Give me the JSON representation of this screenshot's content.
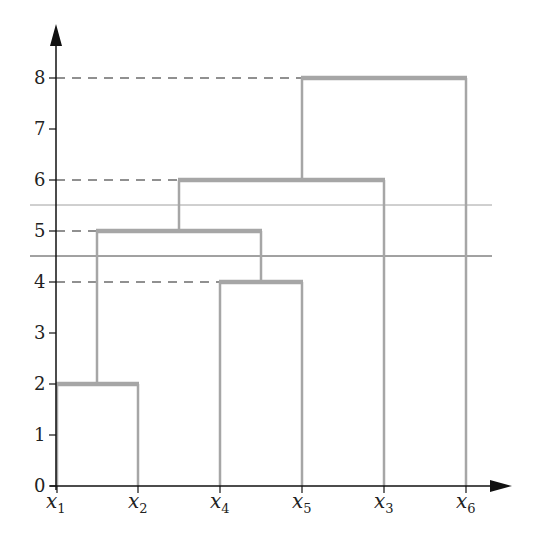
{
  "diagram": {
    "type": "dendrogram",
    "y_axis": {
      "ticks": [
        "0",
        "1",
        "2",
        "3",
        "4",
        "5",
        "6",
        "7",
        "8"
      ],
      "range": [
        0,
        8
      ]
    },
    "leaves": [
      {
        "base": "x",
        "sub": "1"
      },
      {
        "base": "x",
        "sub": "2"
      },
      {
        "base": "x",
        "sub": "4"
      },
      {
        "base": "x",
        "sub": "5"
      },
      {
        "base": "x",
        "sub": "3"
      },
      {
        "base": "x",
        "sub": "6"
      }
    ],
    "merges": [
      {
        "left": "x1",
        "right": "x2",
        "height": 2
      },
      {
        "left": "x4",
        "right": "x5",
        "height": 4
      },
      {
        "left": "{x1,x2}",
        "right": "{x4,x5}",
        "height": 5
      },
      {
        "left": "{x1,x2,x4,x5}",
        "right": "x3",
        "height": 6
      },
      {
        "left": "{x1,x2,x4,x5,x3}",
        "right": "x6",
        "height": 8
      }
    ],
    "dashed_guides": [
      8,
      6,
      5,
      4
    ],
    "cut_lines": [
      {
        "height": 5.5,
        "color": "#9a9a9a"
      },
      {
        "height": 4.5,
        "color": "#444444"
      }
    ],
    "colors": {
      "branch": "#a6a6a6",
      "axis": "#111111",
      "dash": "#222222"
    }
  }
}
